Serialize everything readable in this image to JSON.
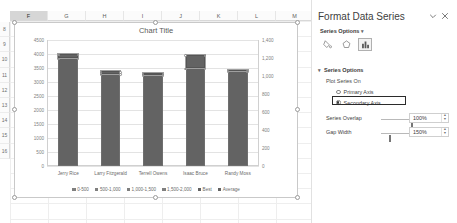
{
  "spreadsheet": {
    "column_headers": [
      "F",
      "G",
      "H",
      "I",
      "J",
      "K",
      "L",
      "M"
    ],
    "selected_column": "F",
    "row_headers": [
      "8",
      "9",
      "10",
      "11",
      "12",
      "13",
      "14",
      "15",
      "16"
    ]
  },
  "chart": {
    "title": "Chart Title",
    "selected": true
  },
  "chart_data": {
    "type": "bar",
    "title": "Chart Title",
    "xlabel": "",
    "ylabel": "",
    "grid": true,
    "legend_position": "bottom",
    "categories": [
      "Jerry Rice",
      "Larry Fitzgerald",
      "Terrell Owens",
      "Isaac Bruce",
      "Randy Moss"
    ],
    "primary_axis": {
      "ticks": [
        "4500",
        "4000",
        "3500",
        "3000",
        "2500",
        "2000",
        "1500",
        "1000",
        "500",
        "0"
      ],
      "ylim": [
        0,
        4500
      ]
    },
    "secondary_axis": {
      "ticks": [
        "1,400",
        "1,200",
        "1,000",
        "800",
        "600",
        "400",
        "200",
        "0"
      ],
      "ylim": [
        0,
        1400
      ]
    },
    "series": [
      {
        "name": "0-500",
        "color": "#7f7f7f",
        "values": [
          500,
          500,
          500,
          500,
          500
        ]
      },
      {
        "name": "500-1,000",
        "color": "#7f7f7f",
        "values": [
          500,
          500,
          500,
          500,
          500
        ]
      },
      {
        "name": "1,000-1,500",
        "color": "#7f7f7f",
        "values": [
          500,
          500,
          500,
          500,
          500
        ]
      },
      {
        "name": "1,500-2,000",
        "color": "#7f7f7f",
        "values": [
          500,
          500,
          500,
          500,
          500
        ]
      },
      {
        "name": "Best",
        "color": "#636363",
        "values": [
          3850,
          3300,
          3250,
          3500,
          3400
        ]
      },
      {
        "name": "Average",
        "color": "#636363",
        "values": [
          150,
          80,
          60,
          480,
          30
        ]
      }
    ],
    "bar_totals": [
      4000,
      3380,
      3310,
      3980,
      3430
    ],
    "bar_base": [
      3850,
      3300,
      3250,
      3500,
      3400
    ]
  },
  "pane": {
    "title": "Format Data Series",
    "collapse_icon": "chevron-down-icon",
    "close_icon": "close-icon",
    "subheader": "Series Options",
    "subheader_caret": "chevron-down-icon",
    "icon_tabs": [
      {
        "name": "fill-and-line-icon",
        "label": "Fill & Line",
        "active": false
      },
      {
        "name": "effects-icon",
        "label": "Effects",
        "active": false
      },
      {
        "name": "series-options-icon",
        "label": "Series Options",
        "active": true
      }
    ],
    "section_title": "Series Options",
    "section_caret": "chevron-down-icon",
    "plot_series_on_label": "Plot Series On",
    "radios": [
      {
        "label": "Primary Axis",
        "checked": false
      },
      {
        "label": "Secondary Axis",
        "checked": true
      }
    ],
    "sliders": [
      {
        "label": "Series Overlap",
        "value": "100%",
        "fill": 100
      },
      {
        "label": "Gap Width",
        "value": "150%",
        "fill": 30
      }
    ]
  }
}
